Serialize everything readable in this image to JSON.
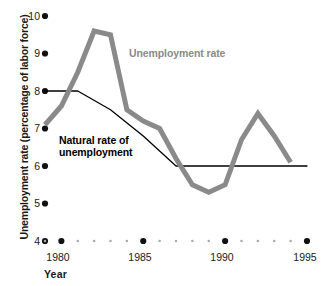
{
  "chart_data": {
    "type": "line",
    "title": "",
    "xlabel": "Year",
    "ylabel": "Unemployment rate (percentage of labor force)",
    "xlim": [
      1979,
      1995
    ],
    "ylim": [
      4,
      10
    ],
    "xticks": [
      1980,
      1985,
      1990,
      1995
    ],
    "xtick_labels": [
      "1980",
      "1985",
      "1990",
      "1995"
    ],
    "yticks": [
      4,
      5,
      6,
      7,
      8,
      9,
      10
    ],
    "ytick_labels": [
      "4",
      "5",
      "6",
      "7",
      "8",
      "9",
      "10"
    ],
    "grid": false,
    "legend_position": "inline-annotation",
    "axis_style": "dotted-markers",
    "series": [
      {
        "name": "Unemployment rate",
        "color": "#8a8a8a",
        "width": 5,
        "x": [
          1979,
          1980,
          1981,
          1982,
          1983,
          1984,
          1985,
          1986,
          1987,
          1988,
          1989,
          1990,
          1991,
          1992,
          1993,
          1994
        ],
        "values": [
          7.1,
          7.6,
          8.5,
          9.6,
          9.5,
          7.5,
          7.2,
          7.0,
          6.2,
          5.5,
          5.3,
          5.5,
          6.7,
          7.4,
          6.8,
          6.1
        ]
      },
      {
        "name": "Natural rate of unemployment",
        "color": "#000000",
        "width": 1.3,
        "x": [
          1979,
          1981,
          1983,
          1985,
          1987,
          1990,
          1995
        ],
        "values": [
          8.0,
          8.0,
          7.5,
          6.8,
          6.0,
          6.0,
          6.0
        ]
      }
    ],
    "annotations": [
      {
        "name": "unemployment-rate-label",
        "text": "Unemployment rate",
        "color": "#8a8a8a"
      },
      {
        "name": "natural-rate-label",
        "text": "Natural rate of\nunemployment",
        "color": "#000000"
      }
    ]
  },
  "axes": {
    "y_axis_title": "Unemployment rate (percentage of labor force)",
    "x_axis_title": "Year",
    "y_ticks": [
      {
        "label": "10",
        "value": 10
      },
      {
        "label": "9",
        "value": 9
      },
      {
        "label": "8",
        "value": 8
      },
      {
        "label": "7",
        "value": 7
      },
      {
        "label": "6",
        "value": 6
      },
      {
        "label": "5",
        "value": 5
      },
      {
        "label": "4",
        "value": 4
      }
    ],
    "x_ticks": [
      {
        "label": "1980",
        "value": 1980
      },
      {
        "label": "1985",
        "value": 1985
      },
      {
        "label": "1990",
        "value": 1990
      },
      {
        "label": "1995",
        "value": 1995
      }
    ]
  },
  "labels": {
    "unemployment_rate": "Unemployment rate",
    "natural_rate_line1": "Natural rate of",
    "natural_rate_line2": "unemployment",
    "year": "Year"
  },
  "colors": {
    "series_gray": "#8a8a8a",
    "series_black": "#000000",
    "background": "#ffffff",
    "text": "#1a1a1a"
  }
}
